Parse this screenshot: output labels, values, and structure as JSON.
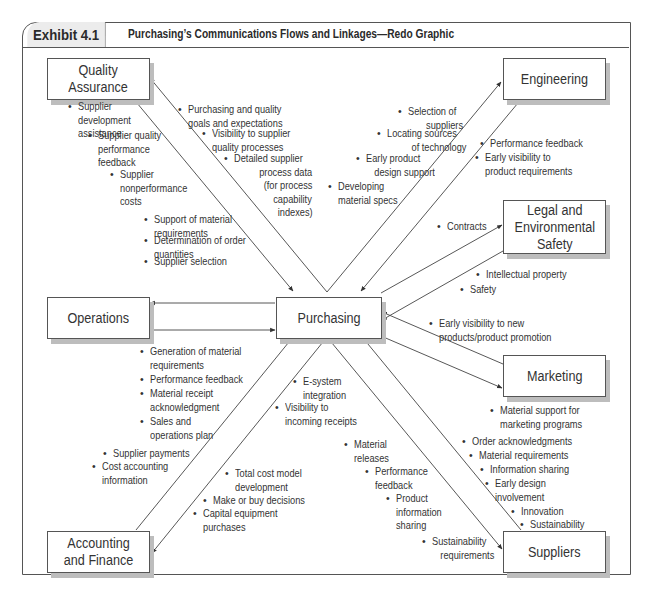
{
  "header": {
    "exhibit_label": "Exhibit 4.1",
    "title": "Purchasing’s Communications Flows and Linkages—Redo Graphic"
  },
  "nodes": {
    "quality": [
      "Quality",
      "Assurance"
    ],
    "engineering": [
      "Engineering"
    ],
    "legal": [
      "Legal and",
      "Environmental",
      "Safety"
    ],
    "operations": [
      "Operations"
    ],
    "purchasing": [
      "Purchasing"
    ],
    "marketing": [
      "Marketing"
    ],
    "accounting": [
      "Accounting",
      "and Finance"
    ],
    "suppliers": [
      "Suppliers"
    ]
  },
  "notes": {
    "quality_to_purchasing": [
      [
        "Supplier",
        "development",
        "assistance"
      ],
      [
        "Supplier quality",
        "performance",
        "feedback"
      ],
      [
        "Supplier",
        "nonperformance",
        "costs"
      ],
      [
        "Support of material",
        "requirements"
      ],
      [
        "Determination of order",
        "quantities"
      ],
      [
        "Supplier selection"
      ]
    ],
    "purchasing_to_quality": [
      [
        "Purchasing and quality",
        "goals and expectations"
      ],
      [
        "Visibility to supplier",
        "quality processes"
      ],
      [
        "Detailed supplier",
        "process data",
        "(for process",
        "capability",
        "indexes)"
      ]
    ],
    "purchasing_to_engineering": [
      [
        "Selection of",
        "suppliers"
      ],
      [
        "Locating sources",
        "of technology"
      ],
      [
        "Early product",
        "design support"
      ],
      [
        "Developing",
        "material specs"
      ]
    ],
    "engineering_to_purchasing": [
      [
        "Performance feedback"
      ],
      [
        "Early visibility to",
        "product requirements"
      ]
    ],
    "purchasing_to_legal": [
      [
        "Contracts"
      ]
    ],
    "legal_to_purchasing": [
      [
        "Intellectual property"
      ],
      [
        "Safety"
      ]
    ],
    "marketing_to_purchasing": [
      [
        "Early visibility to new",
        "products/product promotion"
      ]
    ],
    "purchasing_to_marketing": [
      [
        "Material support for",
        "marketing programs"
      ]
    ],
    "operations_to_purchasing": [
      [
        "Generation of material",
        "requirements"
      ],
      [
        "Performance feedback"
      ],
      [
        "Material receipt",
        "acknowledgment"
      ],
      [
        "Sales and",
        "operations plan"
      ]
    ],
    "purchasing_to_accounting_a": [
      [
        "E-system",
        "integration"
      ],
      [
        "Visibility to",
        "incoming receipts"
      ]
    ],
    "accounting_to_purchasing": [
      [
        "Supplier payments"
      ],
      [
        "Cost accounting",
        "information"
      ]
    ],
    "purchasing_to_accounting_b": [
      [
        "Total cost model",
        "development"
      ],
      [
        "Make or buy decisions"
      ],
      [
        "Capital equipment",
        "purchases"
      ]
    ],
    "purchasing_to_suppliers": [
      [
        "Material",
        "releases"
      ],
      [
        "Performance",
        "feedback"
      ],
      [
        "Product",
        "information",
        "sharing"
      ],
      [
        "Sustainability",
        "requirements"
      ]
    ],
    "suppliers_to_purchasing": [
      [
        "Order acknowledgments"
      ],
      [
        "Material requirements"
      ],
      [
        "Information sharing"
      ],
      [
        "Early design",
        "involvement"
      ],
      [
        "Innovation"
      ],
      [
        "Sustainability"
      ]
    ]
  }
}
